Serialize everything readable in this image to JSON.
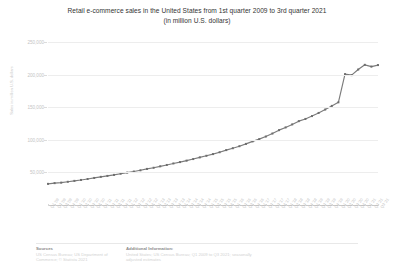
{
  "title": {
    "line1": "Retail e-commerce sales in the United States from 1st quarter 2009 to 3rd quarter 2021",
    "line2": "(in million U.S. dollars)"
  },
  "footer": {
    "sources_head": "Sources",
    "sources_body": "US Census Bureau; US Department of Commerce; © Statista 2021",
    "additional_head": "Additional Information:",
    "additional_body": "United States; US Census Bureau; Q1 2009 to Q3 2021; seasonally adjusted estimates"
  },
  "colors": {
    "line": "#7b7b7b",
    "marker": "#6e6e6e",
    "grid": "#ededed",
    "axis": "#c9c9c9",
    "tick_text": "#c4c4c4",
    "title_text": "#333333"
  },
  "chart_data": {
    "type": "line",
    "title": "Retail e-commerce sales in the United States from 1st quarter 2009 to 3rd quarter 2021",
    "subtitle": "(in million U.S. dollars)",
    "xlabel": "",
    "ylabel": "Sales in million U.S. dollars",
    "ylim": [
      0,
      250000
    ],
    "yticks": [
      50000,
      100000,
      150000,
      200000,
      250000
    ],
    "ytick_labels": [
      "50,000",
      "100,000",
      "150,000",
      "200,000",
      "250,000"
    ],
    "grid": true,
    "legend": false,
    "markers": true,
    "categories": [
      "Q1 '09",
      "Q2 '09",
      "Q3 '09",
      "Q4 '09",
      "Q1 '10",
      "Q2 '10",
      "Q3 '10",
      "Q4 '10",
      "Q1 '11",
      "Q2 '11",
      "Q3 '11",
      "Q4 '11",
      "Q1 '12",
      "Q2 '12",
      "Q3 '12",
      "Q4 '12",
      "Q1 '13",
      "Q2 '13",
      "Q3 '13",
      "Q4 '13",
      "Q1 '14",
      "Q2 '14",
      "Q3 '14",
      "Q4 '14",
      "Q1 '15",
      "Q2 '15",
      "Q3 '15",
      "Q4 '15",
      "Q1 '16",
      "Q2 '16",
      "Q3 '16",
      "Q4 '16",
      "Q1 '17",
      "Q2 '17",
      "Q3 '17",
      "Q4 '17",
      "Q1 '18",
      "Q2 '18",
      "Q3 '18",
      "Q4 '18",
      "Q1 '19",
      "Q2 '19",
      "Q3 '19",
      "Q4 '19",
      "Q1 '20",
      "Q2 '20",
      "Q3 '20",
      "Q4 '20",
      "Q1 '21",
      "Q2 '21",
      "Q3 '21"
    ],
    "values": [
      32402,
      33536,
      34300,
      35576,
      37002,
      38400,
      39856,
      41510,
      43168,
      44622,
      46160,
      47994,
      49692,
      51340,
      53214,
      55358,
      57118,
      59322,
      61392,
      63720,
      65820,
      68060,
      70460,
      73040,
      75470,
      78090,
      80930,
      84200,
      87100,
      90200,
      93700,
      97600,
      101000,
      105000,
      109600,
      114800,
      119000,
      123600,
      128600,
      132000,
      136400,
      141200,
      146400,
      152000,
      157500,
      200700,
      199200,
      207800,
      215000,
      212300,
      214600
    ]
  }
}
